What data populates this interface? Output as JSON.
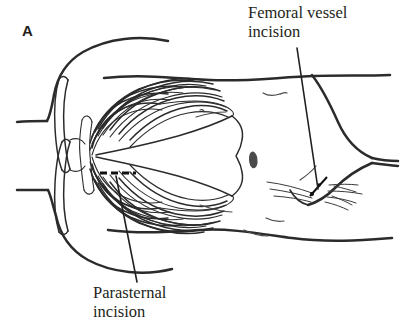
{
  "figure": {
    "panel_label": "A",
    "background_color": "#ffffff",
    "ink_color": "#2b2b2b",
    "text_color": "#231f20",
    "width": 400,
    "height": 333
  },
  "annotations": {
    "femoral": {
      "text": "Femoral vessel\nincision",
      "line1": "Femoral vessel",
      "line2": "incision",
      "leader_from": [
        297,
        48
      ],
      "leader_to": [
        318,
        189
      ]
    },
    "parasternal": {
      "text": "Parasternal\nincision",
      "line1": "Parasternal",
      "line2": "incision",
      "leader_from": [
        137,
        282
      ],
      "leader_to": [
        116,
        176
      ]
    }
  },
  "incisions": [
    {
      "name": "parasternal-incision-mark",
      "style": "dashed",
      "color": "#111111",
      "x1": 100,
      "y1": 173,
      "x2": 136,
      "y2": 173
    },
    {
      "name": "femoral-incision-mark",
      "style": "solid",
      "color": "#111111",
      "x1": 310,
      "y1": 196,
      "x2": 327,
      "y2": 177
    }
  ],
  "anatomy": {
    "rib_pairs_upper": 9,
    "rib_pairs_lower": 9,
    "features": [
      "shoulder",
      "clavicle",
      "sternum",
      "rib-cage",
      "costal-margin",
      "umbilicus",
      "inguinal-crease",
      "thigh"
    ]
  }
}
